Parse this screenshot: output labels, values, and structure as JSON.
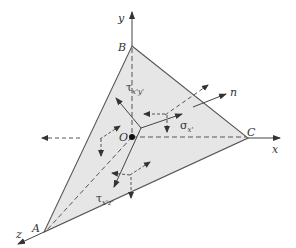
{
  "diagram": {
    "colors": {
      "face_fill": "#e6e6e6",
      "line": "#444444",
      "text": "#333333",
      "background": "#ffffff"
    },
    "axes": {
      "x": "x",
      "y": "y",
      "z": "z"
    },
    "vertices": {
      "A": "A",
      "B": "B",
      "C": "C",
      "O": "O"
    },
    "normal_label": "n",
    "stress_labels": {
      "sigma_main": "σ",
      "sigma_sub": "x'",
      "tau_xy_main": "τ",
      "tau_xy_sub": "x'y'",
      "tau_xz_main": "τ",
      "tau_xz_sub": "x'z'"
    }
  }
}
